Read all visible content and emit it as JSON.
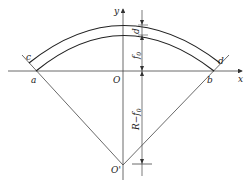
{
  "diagram": {
    "type": "arch geometry",
    "labels": {
      "x_axis": "x",
      "y_axis": "y",
      "origin": "O",
      "center": "O'",
      "point_a": "a",
      "point_b": "b",
      "point_c": "c",
      "point_d": "d",
      "thickness": "d",
      "rise": "f",
      "rise_sub": "0",
      "radius_minus_rise": "R−f",
      "radius_minus_rise_sub": "0"
    },
    "colors": {
      "line": "#333333",
      "background": "#ffffff"
    }
  }
}
